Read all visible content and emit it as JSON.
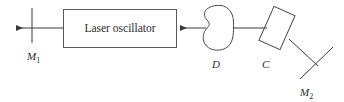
{
  "figure": {
    "type": "optical-laser-setup-diagram",
    "background_color": "#ffffff",
    "stroke_color": "#3a3a3a",
    "text_color": "#2b2b2b",
    "width": 344,
    "height": 102
  },
  "components": {
    "mirror_left": {
      "label_main": "M",
      "label_sub": "1",
      "name": "mirror-m1"
    },
    "laser_box": {
      "text": "Laser oscillator",
      "name": "laser-oscillator-box"
    },
    "detector": {
      "label_main": "D",
      "label_sub": "",
      "name": "detector-d"
    },
    "crystal": {
      "label_main": "C",
      "label_sub": "",
      "name": "crystal-c"
    },
    "mirror_right": {
      "label_main": "M",
      "label_sub": "2",
      "name": "mirror-m2"
    }
  },
  "beam": {
    "output_arrow_direction": "left",
    "input_arrow_direction": "left"
  }
}
